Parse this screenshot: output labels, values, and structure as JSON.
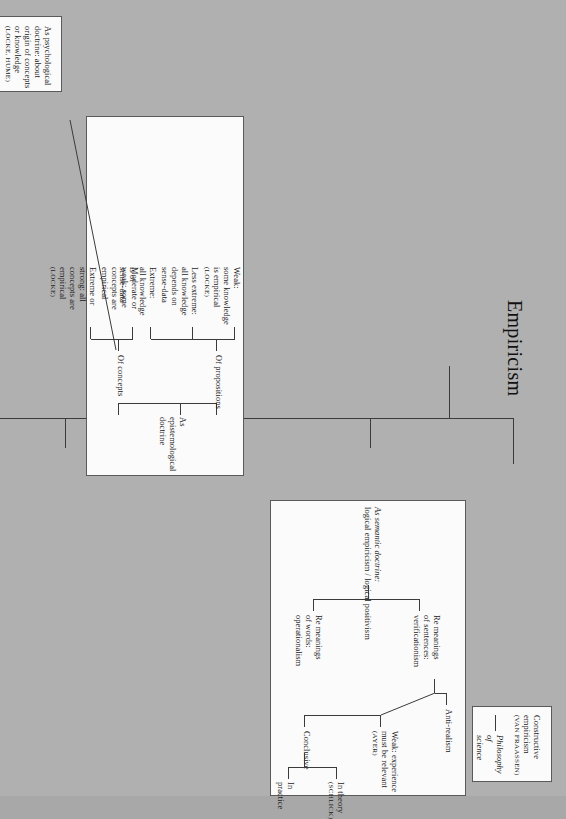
{
  "figure": {
    "title": "Empiricism",
    "page_background": "#b0b0b0",
    "box_fill": "#fbfbfb",
    "line_color": "#3b3b3b",
    "rotation_note": "landscape tree rotated 90 degrees"
  },
  "root_branches": [
    "constructive_empiricism",
    "semantic_doctrine",
    "epistemological_doctrine",
    "psychological_doctrine"
  ],
  "boxes": {
    "constructive": {
      "name": "Constructive empiricism",
      "line1": "Constructive",
      "line2": "empiricism",
      "attribution": "(VAN FRAASSEN)",
      "child": "Philosophy of science",
      "child_line1": "Philosophy of",
      "child_line2": "science"
    },
    "semantic": {
      "heading_line1": "As semantic doctrine:",
      "heading_line2": "logical empiricism / logical positivism",
      "words": {
        "line1": "Re meanings",
        "line2": "of words:",
        "line3": "operationalism"
      },
      "sentences": {
        "line1": "Re meanings",
        "line2": "of sentences:",
        "line3": "verificationism"
      },
      "anti_realism": "Anti-realism",
      "weak": {
        "line1": "Weak: experience",
        "line2": "must be relevant",
        "attribution": "(AYER)"
      },
      "conclusive": "Conclusive",
      "in_theory": {
        "line1": "In theory",
        "attribution": "(SCHLICK)"
      },
      "in_practice": "In practice"
    },
    "epistemological": {
      "heading": "As epistemological doctrine",
      "of_concepts": "Of concepts",
      "of_propositions": "Of propositions",
      "concepts_extreme": {
        "line1": "Extreme or",
        "line2": "strong: all",
        "line3": "concepts are",
        "line4": "empirical",
        "attribution": "(LOCKE)"
      },
      "concepts_moderate": {
        "line1": "Moderate or",
        "line2": "weak: some",
        "line3": "concepts are",
        "line4": "empirical"
      },
      "prop_extreme": {
        "line1": "Extreme:",
        "line2": "all knowledge",
        "line3": "is of",
        "line4": "sense-data"
      },
      "prop_less_extreme": {
        "line1": "Less extreme:",
        "line2": "all knowledge",
        "line3": "depends on",
        "line4": "sense-data"
      },
      "prop_weak": {
        "line1": "Weak:",
        "line2": "some knowledge",
        "line3": "is empirical",
        "attribution": "(LOCKE)"
      }
    },
    "psychological": {
      "line1": "As psychological",
      "line2": "doctrine: about",
      "line3": "origin of concepts",
      "line4": "or knowledge",
      "attribution": "(LOCKE, HUME)"
    }
  }
}
